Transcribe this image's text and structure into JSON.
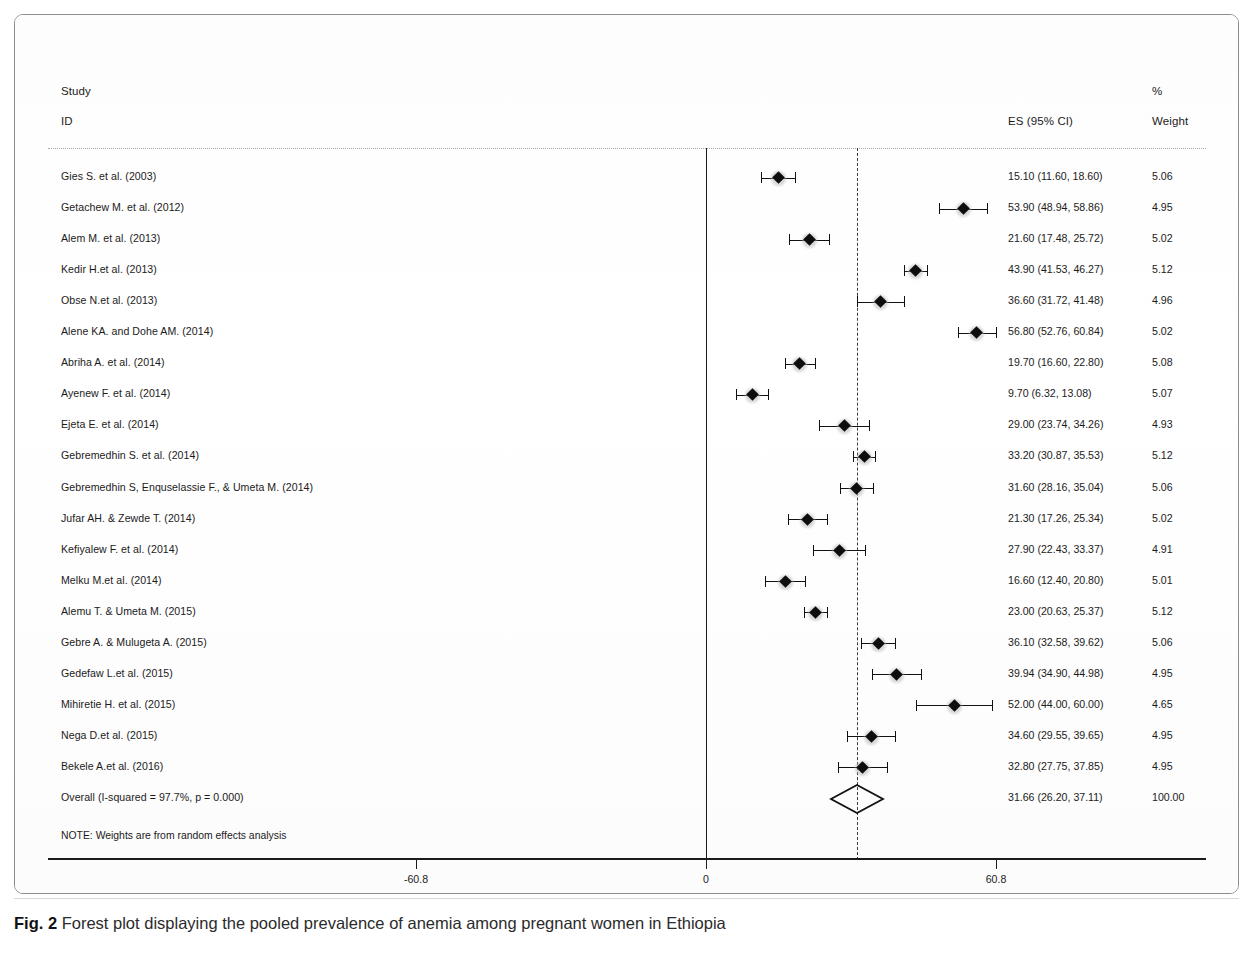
{
  "header": {
    "study": "Study",
    "id": "ID",
    "es": "ES (95% CI)",
    "percent": "%",
    "weight": "Weight"
  },
  "note": "NOTE: Weights are from random effects analysis",
  "caption": {
    "label": "Fig. 2",
    "text": " Forest plot displaying the pooled prevalence of anemia among pregnant women in Ethiopia"
  },
  "axis": {
    "ticks": [
      {
        "label": "-60.8",
        "value": -60.8
      },
      {
        "label": "0",
        "value": 0
      },
      {
        "label": "60.8",
        "value": 60.8
      }
    ]
  },
  "chart_data": {
    "type": "forest",
    "title": "Forest plot displaying the pooled prevalence of anemia among pregnant women in Ethiopia",
    "xlabel": "",
    "ylabel": "",
    "xlim": [
      -60.8,
      60.8
    ],
    "grid": false,
    "legend": "none",
    "effect_measure": "ES (95% CI)",
    "null_line": 0,
    "pooled_line": 31.66,
    "heterogeneity": "I-squared = 97.7%, p = 0.000",
    "columns": [
      "Study ID",
      "ES (95% CI)",
      "% Weight"
    ],
    "studies": [
      {
        "label": "Gies S. et al. (2003)",
        "es": 15.1,
        "lower": 11.6,
        "upper": 18.6,
        "es_text": "15.10 (11.60, 18.60)",
        "weight": "5.06"
      },
      {
        "label": "Getachew M. et al. (2012)",
        "es": 53.9,
        "lower": 48.94,
        "upper": 58.86,
        "es_text": "53.90 (48.94, 58.86)",
        "weight": "4.95"
      },
      {
        "label": "Alem M. et al. (2013)",
        "es": 21.6,
        "lower": 17.48,
        "upper": 25.72,
        "es_text": "21.60 (17.48, 25.72)",
        "weight": "5.02"
      },
      {
        "label": "Kedir H.et al. (2013)",
        "es": 43.9,
        "lower": 41.53,
        "upper": 46.27,
        "es_text": "43.90 (41.53, 46.27)",
        "weight": "5.12"
      },
      {
        "label": "Obse N.et al. (2013)",
        "es": 36.6,
        "lower": 31.72,
        "upper": 41.48,
        "es_text": "36.60 (31.72, 41.48)",
        "weight": "4.96"
      },
      {
        "label": "Alene KA. and Dohe AM. (2014)",
        "es": 56.8,
        "lower": 52.76,
        "upper": 60.84,
        "es_text": "56.80 (52.76, 60.84)",
        "weight": "5.02"
      },
      {
        "label": "Abriha A. et al. (2014)",
        "es": 19.7,
        "lower": 16.6,
        "upper": 22.8,
        "es_text": "19.70 (16.60, 22.80)",
        "weight": "5.08"
      },
      {
        "label": "Ayenew F. et al. (2014)",
        "es": 9.7,
        "lower": 6.32,
        "upper": 13.08,
        "es_text": "9.70 (6.32, 13.08)",
        "weight": "5.07"
      },
      {
        "label": "Ejeta E. et al. (2014)",
        "es": 29.0,
        "lower": 23.74,
        "upper": 34.26,
        "es_text": "29.00 (23.74, 34.26)",
        "weight": "4.93"
      },
      {
        "label": "Gebremedhin S. et al.  (2014)",
        "es": 33.2,
        "lower": 30.87,
        "upper": 35.53,
        "es_text": "33.20 (30.87, 35.53)",
        "weight": "5.12"
      },
      {
        "label": "Gebremedhin S, Enquselassie F., & Umeta M. (2014)",
        "es": 31.6,
        "lower": 28.16,
        "upper": 35.04,
        "es_text": "31.60 (28.16, 35.04)",
        "weight": "5.06"
      },
      {
        "label": "Jufar AH. & Zewde T. (2014)",
        "es": 21.3,
        "lower": 17.26,
        "upper": 25.34,
        "es_text": "21.30 (17.26, 25.34)",
        "weight": "5.02"
      },
      {
        "label": "Kefiyalew F. et al. (2014)",
        "es": 27.9,
        "lower": 22.43,
        "upper": 33.37,
        "es_text": "27.90 (22.43, 33.37)",
        "weight": "4.91"
      },
      {
        "label": "Melku M.et al. (2014)",
        "es": 16.6,
        "lower": 12.4,
        "upper": 20.8,
        "es_text": "16.60 (12.40, 20.80)",
        "weight": "5.01"
      },
      {
        "label": "Alemu T. & Umeta M. (2015)",
        "es": 23.0,
        "lower": 20.63,
        "upper": 25.37,
        "es_text": "23.00 (20.63, 25.37)",
        "weight": "5.12"
      },
      {
        "label": "Gebre A. & Mulugeta A. (2015)",
        "es": 36.1,
        "lower": 32.58,
        "upper": 39.62,
        "es_text": "36.10 (32.58, 39.62)",
        "weight": "5.06"
      },
      {
        "label": "Gedefaw L.et al. (2015)",
        "es": 39.94,
        "lower": 34.9,
        "upper": 44.98,
        "es_text": "39.94 (34.90, 44.98)",
        "weight": "4.95"
      },
      {
        "label": "Mihiretie H. et al. (2015)",
        "es": 52.0,
        "lower": 44.0,
        "upper": 60.0,
        "es_text": "52.00 (44.00, 60.00)",
        "weight": "4.65"
      },
      {
        "label": "Nega D.et al. (2015)",
        "es": 34.6,
        "lower": 29.55,
        "upper": 39.65,
        "es_text": "34.60 (29.55, 39.65)",
        "weight": "4.95"
      },
      {
        "label": "Bekele A.et al. (2016)",
        "es": 32.8,
        "lower": 27.75,
        "upper": 37.85,
        "es_text": "32.80 (27.75, 37.85)",
        "weight": "4.95"
      }
    ],
    "overall": {
      "label": "Overall  (I-squared = 97.7%, p = 0.000)",
      "es": 31.66,
      "lower": 26.2,
      "upper": 37.11,
      "es_text": "31.66 (26.20, 37.11)",
      "weight": "100.00"
    }
  }
}
